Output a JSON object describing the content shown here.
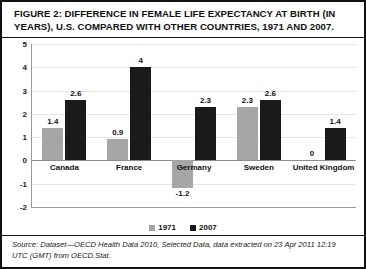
{
  "figure": {
    "title": "FIGURE 2: DIFFERENCE IN FEMALE LIFE EXPECTANCY AT BIRTH (IN YEARS), U.S. COMPARED WITH OTHER COUNTRIES, 1971 AND 2007.",
    "source": "Source: Dataset—OECD Health Data 2010, Selected Data, data extracted on 23 Apr 2011 12:19 UTC (GMT) from OECD.Stat."
  },
  "chart_data": {
    "type": "bar",
    "title": "FIGURE 2: DIFFERENCE IN FEMALE LIFE EXPECTANCY AT BIRTH (IN YEARS), U.S. COMPARED WITH OTHER COUNTRIES, 1971 AND 2007.",
    "xlabel": "",
    "ylabel": "",
    "ylim": [
      -2,
      5
    ],
    "yticks": [
      "5",
      "4",
      "3",
      "2",
      "1",
      "0",
      "-1",
      "-2"
    ],
    "ytick_values": [
      5,
      4,
      3,
      2,
      1,
      0,
      -1,
      -2
    ],
    "grid": true,
    "legend_position": "bottom",
    "categories": [
      "Canada",
      "France",
      "Germany",
      "Sweden",
      "United Kingdom"
    ],
    "series": [
      {
        "name": "1971",
        "color": "#a6a6a6",
        "values": [
          1.4,
          0.9,
          -1.2,
          2.3,
          0
        ],
        "labels": [
          "1.4",
          "0.9",
          "-1.2",
          "2.3",
          "0"
        ]
      },
      {
        "name": "2007",
        "color": "#1a1a1a",
        "values": [
          2.6,
          4,
          2.3,
          2.6,
          1.4
        ],
        "labels": [
          "2.6",
          "4",
          "2.3",
          "2.6",
          "1.4"
        ]
      }
    ]
  },
  "legend": [
    {
      "label": "1971"
    },
    {
      "label": "2007"
    }
  ]
}
